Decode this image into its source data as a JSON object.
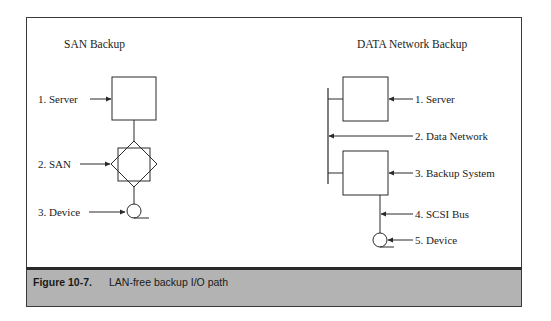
{
  "figure": {
    "caption_number": "Figure 10-7.",
    "caption_text": "LAN-free backup I/O path"
  },
  "san_backup": {
    "title": "SAN Backup",
    "labels": [
      "1. Server",
      "2. SAN",
      "3. Device"
    ]
  },
  "data_network_backup": {
    "title": "DATA Network Backup",
    "labels": [
      "1. Server",
      "2. Data Network",
      "3. Backup System",
      "4. SCSI Bus",
      "5. Device"
    ]
  },
  "colors": {
    "line": "#2a2a2a",
    "caption_bg": "#b3b3b3",
    "background": "#ffffff"
  }
}
